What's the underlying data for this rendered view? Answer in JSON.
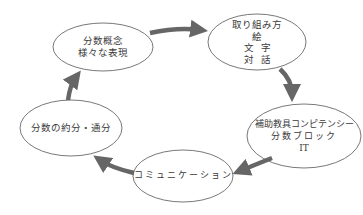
{
  "diagram": {
    "type": "cycle",
    "colors": {
      "ellipse_stroke": "#555555",
      "arrow": "#666666",
      "text": "#3a3a3a",
      "background": "#ffffff"
    },
    "nodes": [
      {
        "id": "concept",
        "lines": [
          "分数概念",
          "様々な表現"
        ]
      },
      {
        "id": "approach",
        "lines": [
          "取り組み方",
          "絵",
          "文字",
          "対話"
        ]
      },
      {
        "id": "aids",
        "lines": [
          "補助教具コンピテンシー",
          "分数ブロック",
          "IT"
        ]
      },
      {
        "id": "communication",
        "lines": [
          "コミュニケーション"
        ]
      },
      {
        "id": "reduction",
        "lines": [
          "分数の約分・通分"
        ]
      }
    ],
    "edges": [
      {
        "from": "concept",
        "to": "approach"
      },
      {
        "from": "approach",
        "to": "aids"
      },
      {
        "from": "aids",
        "to": "communication"
      },
      {
        "from": "communication",
        "to": "reduction"
      },
      {
        "from": "reduction",
        "to": "concept"
      }
    ]
  }
}
